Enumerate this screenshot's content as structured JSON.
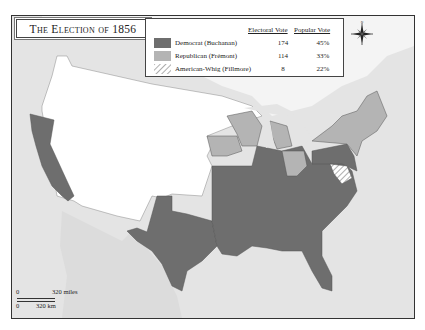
{
  "title": "The Election of 1856",
  "legend": {
    "headers": {
      "electoral": "Electoral Vote",
      "popular": "Popular Vote"
    },
    "entries": [
      {
        "party": "Democrat (Buchanan)",
        "electoral": "174",
        "popular": "45%",
        "color": "#6e6e6e",
        "pattern": "solid"
      },
      {
        "party": "Republican (Frémont)",
        "electoral": "114",
        "popular": "33%",
        "color": "#b4b4b4",
        "pattern": "solid"
      },
      {
        "party": "American-Whig (Fillmore)",
        "electoral": "8",
        "popular": "22%",
        "color": "#cfcfcf",
        "pattern": "hatched"
      }
    ]
  },
  "compass": {
    "n": "N",
    "s": "S",
    "e": "E",
    "w": "W"
  },
  "scale": {
    "zero_top": "0",
    "miles": "320 miles",
    "zero_bottom": "0",
    "km": "320 km"
  },
  "colors": {
    "water": "#e4e4e4",
    "land_unorganized": "#ffffff",
    "democrat": "#6e6e6e",
    "republican": "#b4b4b4",
    "foreign": "#dcdcdc",
    "border": "#555555"
  }
}
